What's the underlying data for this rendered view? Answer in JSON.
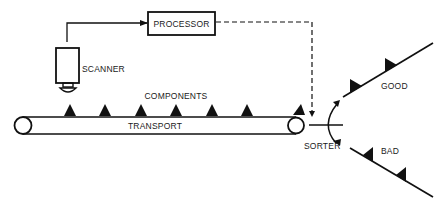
{
  "diagram": {
    "title": "",
    "labels": {
      "processor": "PROCESSOR",
      "scanner": "SCANNER",
      "components": "COMPONENTS",
      "transport": "TRANSPORT",
      "sorter": "SORTER",
      "good": "GOOD",
      "bad": "BAD"
    },
    "nodes": [
      {
        "id": "scanner",
        "label": "SCANNER",
        "shape": "camera"
      },
      {
        "id": "processor",
        "label": "PROCESSOR",
        "shape": "box"
      },
      {
        "id": "transport",
        "label": "TRANSPORT",
        "shape": "conveyor"
      },
      {
        "id": "sorter",
        "label": "SORTER",
        "shape": "pivot-gate"
      },
      {
        "id": "good",
        "label": "GOOD",
        "shape": "chute"
      },
      {
        "id": "bad",
        "label": "BAD",
        "shape": "chute"
      }
    ],
    "edges": [
      {
        "from": "scanner",
        "to": "processor",
        "style": "solid-arrow"
      },
      {
        "from": "processor",
        "to": "sorter",
        "style": "dashed-arrow"
      },
      {
        "from": "transport",
        "to": "sorter",
        "style": "flow"
      },
      {
        "from": "sorter",
        "to": "good",
        "style": "flow"
      },
      {
        "from": "sorter",
        "to": "bad",
        "style": "flow"
      }
    ],
    "components_on_belt": 7,
    "components_on_good_chute": 2,
    "components_on_bad_chute": 2,
    "colors": {
      "ink": "#111111",
      "background": "#ffffff"
    }
  }
}
